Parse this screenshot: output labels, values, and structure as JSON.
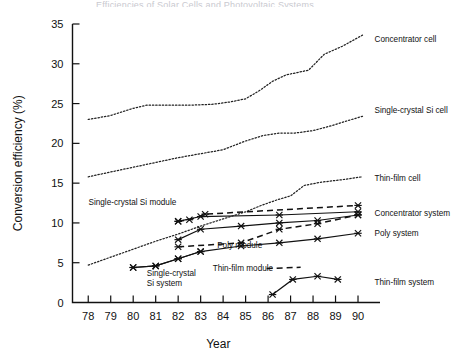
{
  "title_clipped": "Efficiencies of Solar Cells and Photovoltaic Systems",
  "chart_data": {
    "type": "line",
    "title": "",
    "xlabel": "Year",
    "ylabel": "Conversion efficiency (%)",
    "xlim": [
      77.3,
      90.8
    ],
    "ylim": [
      0,
      35
    ],
    "yticks": [
      0,
      5,
      10,
      15,
      20,
      25,
      30,
      35
    ],
    "xticks": [
      78,
      79,
      80,
      81,
      82,
      83,
      84,
      85,
      86,
      87,
      88,
      89,
      90
    ],
    "xtick_labels": [
      "78",
      "79",
      "80",
      "81",
      "82",
      "83",
      "84",
      "85",
      "86",
      "87",
      "88",
      "89",
      "90"
    ],
    "ytick_labels": [
      "0",
      "5",
      "10",
      "15",
      "20",
      "25",
      "30",
      "35"
    ],
    "grid": false,
    "legend": "inline-labels",
    "series": [
      {
        "name": "Concentrator cell",
        "style": "dotted",
        "markers": false,
        "label_x": 90.6,
        "label_y": 33.1,
        "label_anchor": "start",
        "x": [
          78.0,
          79.0,
          80.0,
          80.6,
          81.5,
          82.5,
          83.5,
          84.3,
          85.0,
          85.6,
          86.2,
          86.8,
          87.3,
          87.8,
          88.5,
          89.3,
          90.2
        ],
        "y": [
          23.0,
          23.5,
          24.4,
          24.8,
          24.8,
          24.8,
          24.9,
          25.2,
          25.6,
          26.6,
          27.8,
          28.6,
          28.9,
          29.2,
          31.2,
          32.2,
          33.6
        ]
      },
      {
        "name": "Single-crystal Si cell",
        "style": "dotted",
        "markers": false,
        "label_x": 90.6,
        "label_y": 24.2,
        "label_anchor": "start",
        "x": [
          78.0,
          79.0,
          80.0,
          81.0,
          82.0,
          83.0,
          84.0,
          85.0,
          85.8,
          86.5,
          87.2,
          88.0,
          88.8,
          89.6,
          90.2
        ],
        "y": [
          15.8,
          16.4,
          17.0,
          17.6,
          18.2,
          18.7,
          19.2,
          20.3,
          21.0,
          21.3,
          21.3,
          21.6,
          22.2,
          22.9,
          23.4
        ]
      },
      {
        "name": "Thin-film cell",
        "style": "dotted",
        "markers": false,
        "label_x": 90.6,
        "label_y": 15.6,
        "label_anchor": "start",
        "x": [
          78.0,
          79.0,
          80.0,
          81.0,
          82.0,
          83.0,
          84.0,
          85.0,
          85.7,
          86.4,
          87.0,
          87.6,
          88.3,
          89.2,
          90.2
        ],
        "y": [
          4.7,
          5.7,
          6.7,
          7.7,
          8.6,
          9.6,
          10.5,
          11.4,
          12.2,
          12.9,
          13.4,
          14.7,
          15.1,
          15.4,
          15.8
        ]
      },
      {
        "name": "Single-crystal Si module",
        "style": "dashed",
        "markers": true,
        "label_x": 82.05,
        "label_y": 12.65,
        "label_anchor": "end",
        "x": [
          82.0,
          82.5,
          83.2,
          90.0
        ],
        "y": [
          10.2,
          10.4,
          11.1,
          12.2
        ]
      },
      {
        "name": "Concentrator system",
        "style": "solid",
        "markers": true,
        "label_x": 90.6,
        "label_y": 11.3,
        "label_anchor": "start",
        "x": [
          82.0,
          83.0,
          86.5,
          90.0
        ],
        "y": [
          10.2,
          10.8,
          11.0,
          11.4
        ]
      },
      {
        "name": "Poly module",
        "style": "solid",
        "markers": true,
        "label_x": 83.6,
        "label_y": 7.2,
        "label_anchor": "start",
        "x": [
          82.0,
          83.0,
          84.8,
          86.5,
          88.2,
          90.0
        ],
        "y": [
          7.9,
          9.2,
          9.6,
          10.0,
          10.3,
          11.0
        ]
      },
      {
        "name": "Poly system",
        "style": "solid",
        "markers": true,
        "label_x": 90.6,
        "label_y": 8.7,
        "label_anchor": "start",
        "x": [
          80.0,
          81.0,
          82.0,
          83.0,
          84.8,
          86.5,
          88.2,
          90.0
        ],
        "y": [
          4.4,
          4.6,
          5.5,
          6.4,
          7.1,
          7.5,
          8.0,
          8.7
        ]
      },
      {
        "name": "Thin-film module",
        "style": "dashed",
        "markers": true,
        "label_x": 83.4,
        "label_y": 4.3,
        "label_anchor": "start",
        "x": [
          82.0,
          84.8,
          86.5,
          88.2,
          90.0
        ],
        "y": [
          7.0,
          7.5,
          9.2,
          9.9,
          11.0
        ]
      },
      {
        "name": "Thin-film system",
        "style": "solid",
        "markers": true,
        "label_x": 90.6,
        "label_y": 2.6,
        "label_anchor": "start",
        "x": [
          86.2,
          87.1,
          88.2,
          89.1
        ],
        "y": [
          1.0,
          2.9,
          3.3,
          2.9
        ]
      },
      {
        "name": "Single-crystal Si system",
        "style": "solid",
        "markers": true,
        "label_x": 80.6,
        "label_y": 3.1,
        "label_anchor": "start",
        "x": [
          80.0,
          81.0,
          82.0,
          83.0
        ],
        "y": [
          4.4,
          4.6,
          5.5,
          6.4
        ]
      }
    ],
    "annotations": [
      {
        "name": "single-crystal-si-system-label-line1",
        "text": "Single-crystal",
        "x": 80.6,
        "y": 3.3
      },
      {
        "name": "single-crystal-si-system-label-line2",
        "text": "Si system",
        "x": 80.6,
        "y": 2.1
      },
      {
        "name": "thin-film-module-dash-sample",
        "text": "",
        "x": 0,
        "y": 0
      }
    ]
  }
}
